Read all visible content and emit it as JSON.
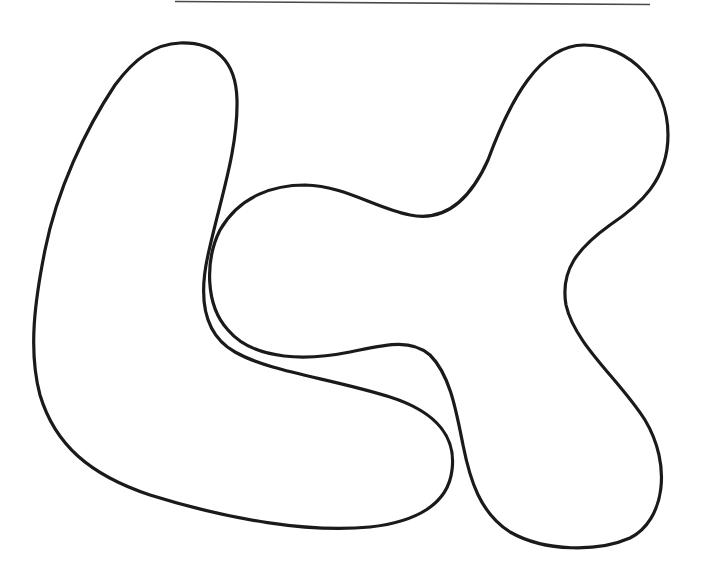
{
  "image": {
    "width": 703,
    "height": 574,
    "background": "#ffffff",
    "description": "Two interlocking hand-drawn closed outlines: an L-shaped blob on the left and a three-lobed blob on the right, with a thin horizontal rule at the top"
  },
  "top_rule": {
    "color": "#4a4a4a",
    "x1": 175,
    "y1": 1.5,
    "x2": 650,
    "y2": 4.5,
    "width": 1.6
  },
  "shapes": [
    {
      "name": "left-l-blob",
      "stroke": "#1a1a1a",
      "stroke_width": 3.2,
      "path": "M 180 43 C 215 42 236 60 237 100 C 238 150 220 200 208 255 C 198 300 205 335 235 352 C 270 372 330 378 390 397 C 440 413 456 440 452 470 C 448 505 415 522 370 527 C 310 533 230 520 150 495 C 90 475 55 445 40 395 C 28 350 35 300 45 250 C 57 190 85 130 115 85 C 135 58 155 44 180 43 Z"
    },
    {
      "name": "right-three-lobe-blob",
      "stroke": "#1a1a1a",
      "stroke_width": 3.2,
      "path": "M 584 45 C 630 45 668 85 668 135 C 668 180 640 205 610 225 C 578 248 560 270 566 305 C 575 345 620 380 645 420 C 672 465 665 520 630 538 C 598 552 545 552 510 532 C 480 513 470 480 463 445 C 456 410 450 375 430 355 C 410 338 385 345 350 352 C 310 360 255 362 228 330 C 205 305 205 260 220 230 C 240 195 275 185 305 185 C 345 186 375 208 410 215 C 445 222 470 200 488 160 C 510 100 540 45 584 45 Z"
    }
  ]
}
